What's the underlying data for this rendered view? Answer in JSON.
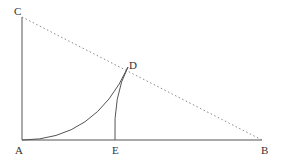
{
  "diagram": {
    "type": "geometry",
    "points": {
      "A": {
        "label": "A",
        "x": 22,
        "y": 140
      },
      "B": {
        "label": "B",
        "x": 262,
        "y": 140
      },
      "C": {
        "label": "C",
        "x": 22,
        "y": 17
      },
      "D": {
        "label": "D",
        "x": 128,
        "y": 67
      },
      "E": {
        "label": "E",
        "x": 115,
        "y": 140
      }
    },
    "segments": [
      {
        "from": "A",
        "to": "B",
        "style": "solid"
      },
      {
        "from": "A",
        "to": "C",
        "style": "solid"
      },
      {
        "from": "C",
        "to": "B",
        "style": "dotted"
      }
    ],
    "curves": [
      {
        "from": "A",
        "to": "D",
        "style": "solid",
        "kind": "concave-up arc"
      },
      {
        "from": "E",
        "to": "D",
        "style": "solid",
        "kind": "arc"
      }
    ],
    "colors": {
      "line": "#555555",
      "dotted": "#888888",
      "text": "#333333"
    }
  }
}
